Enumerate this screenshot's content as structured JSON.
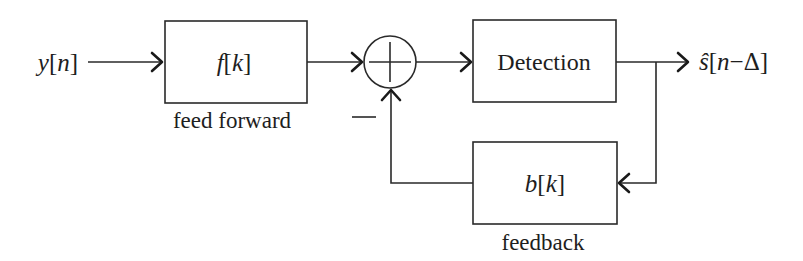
{
  "diagram": {
    "colors": {
      "line": "#2a2a2a",
      "text": "#1e1e1e",
      "background": "#ffffff"
    },
    "input": {
      "label": "y[n]",
      "var": "y",
      "index": "n"
    },
    "output": {
      "label": "ŝ[n−Δ]",
      "var": "ŝ",
      "index": "n",
      "op": "−",
      "delay": "Δ"
    },
    "blocks": [
      {
        "id": "feedforward",
        "text": "f[k]",
        "var": "f",
        "index": "k",
        "caption": "feed forward"
      },
      {
        "id": "detection",
        "text": "Detection",
        "caption": ""
      },
      {
        "id": "feedback",
        "text": "b[k]",
        "var": "b",
        "index": "k",
        "caption": "feedback"
      }
    ],
    "summer": {
      "symbol": "+",
      "feedback_sign": "−"
    },
    "edges": [
      {
        "from": "input",
        "to": "feedforward"
      },
      {
        "from": "feedforward",
        "to": "summer"
      },
      {
        "from": "summer",
        "to": "detection"
      },
      {
        "from": "detection",
        "to": "output"
      },
      {
        "from": "detection",
        "to": "feedback"
      },
      {
        "from": "feedback",
        "to": "summer",
        "sign": "−"
      }
    ]
  }
}
